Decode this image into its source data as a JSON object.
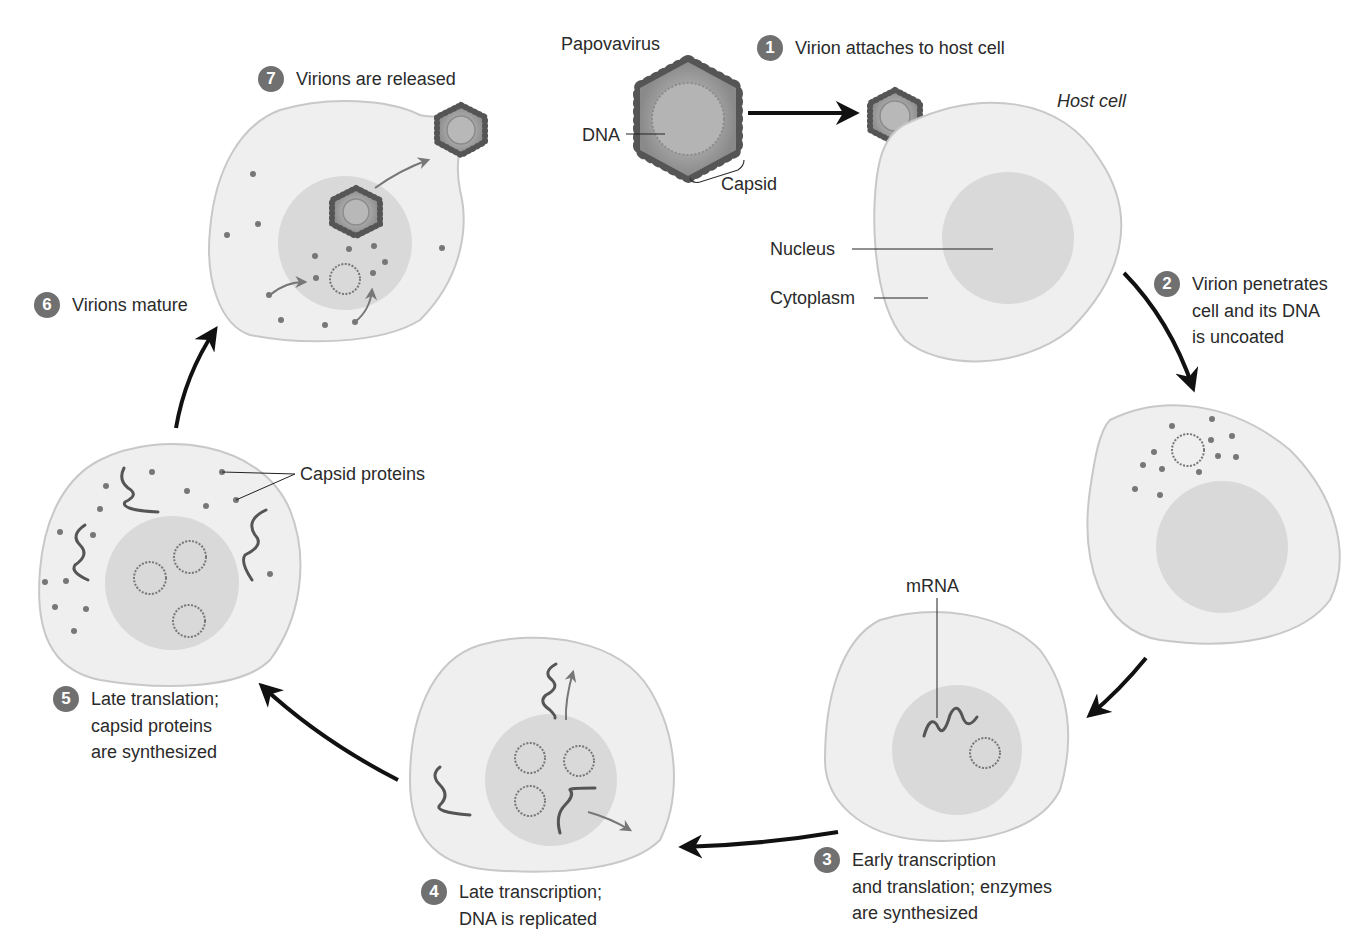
{
  "figure": {
    "virus_label": "Papovavirus",
    "dna_label": "DNA",
    "capsid_label": "Capsid",
    "host_cell_label": "Host cell",
    "nucleus_label": "Nucleus",
    "cytoplasm_label": "Cytoplasm",
    "mrna_label": "mRNA",
    "capsid_proteins_label": "Capsid proteins"
  },
  "steps": [
    {
      "number": "1",
      "text": "Virion attaches to host cell"
    },
    {
      "number": "2",
      "text": "Virion penetrates\ncell and its DNA\nis uncoated"
    },
    {
      "number": "3",
      "text": "Early transcription\nand translation; enzymes\nare synthesized"
    },
    {
      "number": "4",
      "text": "Late transcription;\nDNA is replicated"
    },
    {
      "number": "5",
      "text": "Late translation;\ncapsid proteins\nare synthesized"
    },
    {
      "number": "6",
      "text": "Virions mature"
    },
    {
      "number": "7",
      "text": "Virions are released"
    }
  ],
  "colors": {
    "cell_fill": "#efefef",
    "cell_stroke": "#c8c8c8",
    "nucleus_fill": "#d9d9d9",
    "badge": "#707070",
    "protein_dot": "#7a7a7a",
    "arrow": "#111111"
  }
}
